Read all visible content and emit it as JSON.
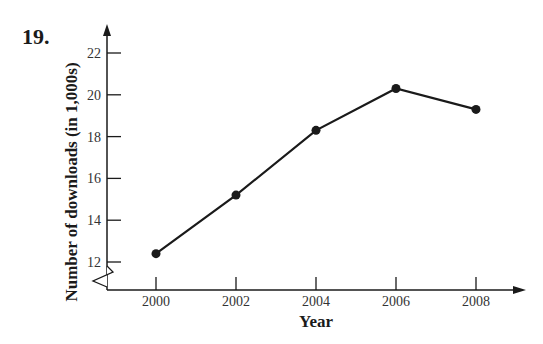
{
  "problem": {
    "number": "19."
  },
  "chart_data": {
    "type": "line",
    "title": "",
    "xlabel": "Year",
    "ylabel": "Number of downloads (in 1,000s)",
    "x": [
      2000,
      2002,
      2004,
      2006,
      2008
    ],
    "categories": [
      "2000",
      "2002",
      "2004",
      "2006",
      "2008"
    ],
    "series": [
      {
        "name": "Downloads",
        "values": [
          12.4,
          15.2,
          18.3,
          20.3,
          19.3
        ]
      }
    ],
    "y_ticks": [
      12,
      14,
      16,
      18,
      20,
      22
    ],
    "y_tick_labels": [
      "12",
      "14",
      "16",
      "18",
      "20",
      "22"
    ],
    "x_tick_labels": [
      "2000",
      "2002",
      "2004",
      "2006",
      "2008"
    ],
    "ylim": [
      12,
      22
    ],
    "y_axis_break": true,
    "grid": false,
    "legend": "none",
    "markers": "filled-circle",
    "line_color": "#1a1a1a"
  }
}
